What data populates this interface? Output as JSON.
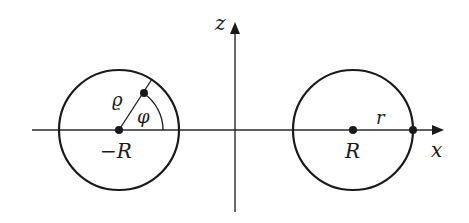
{
  "diagram": {
    "type": "coordinate-geometry",
    "axes": {
      "x_label": "x",
      "z_label": "z"
    },
    "left_circle": {
      "center_label": "−R",
      "radius_label": "ϱ",
      "angle_label": "φ"
    },
    "right_circle": {
      "center_label": "R",
      "radius_label": "r"
    },
    "colors": {
      "stroke": "#1a1a1a",
      "background": "#ffffff"
    }
  }
}
